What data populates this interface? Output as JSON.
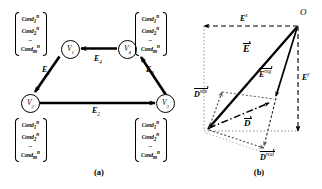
{
  "figure": {
    "panels": [
      {
        "id": "a",
        "caption": "(a)",
        "type": "directed-graph"
      },
      {
        "id": "b",
        "caption": "(b)",
        "type": "vector-decomposition"
      }
    ]
  },
  "panel_a": {
    "caption": "(a)",
    "nodes": [
      {
        "name": "V",
        "index": "1",
        "id": "v1"
      },
      {
        "name": "V",
        "index": "2",
        "id": "v2"
      },
      {
        "name": "V",
        "index": "3",
        "id": "v3"
      },
      {
        "name": "V",
        "index": "4",
        "id": "v4"
      }
    ],
    "edges": [
      {
        "name": "E",
        "index": "1",
        "from": "v1",
        "to": "v2"
      },
      {
        "name": "E",
        "index": "2",
        "from": "v2",
        "to": "v3"
      },
      {
        "name": "E",
        "index": "3",
        "from": "v3",
        "to": "v4"
      },
      {
        "name": "E",
        "index": "4",
        "from": "v4",
        "to": "v1"
      }
    ],
    "condition_blocks": [
      {
        "attached_to": "v1",
        "position": "top-left",
        "rows": [
          {
            "base": "Cond",
            "sub": "1",
            "sup": "n"
          },
          {
            "base": "Cond",
            "sub": "2",
            "sup": "n"
          },
          {
            "base": "...",
            "sub": "",
            "sup": ""
          },
          {
            "base": "Cond",
            "sub": "m",
            "sup": "n"
          }
        ]
      },
      {
        "attached_to": "v4",
        "position": "top-right",
        "rows": [
          {
            "base": "Cond",
            "sub": "1",
            "sup": "n"
          },
          {
            "base": "Cond",
            "sub": "2",
            "sup": "n"
          },
          {
            "base": "...",
            "sub": "",
            "sup": ""
          },
          {
            "base": "Cond",
            "sub": "m",
            "sup": "n"
          }
        ]
      },
      {
        "attached_to": "v2",
        "position": "bottom-left",
        "rows": [
          {
            "base": "Cond",
            "sub": "1",
            "sup": "n"
          },
          {
            "base": "Cond",
            "sub": "2",
            "sup": "n"
          },
          {
            "base": "...",
            "sub": "",
            "sup": ""
          },
          {
            "base": "Cond",
            "sub": "m",
            "sup": "n"
          }
        ]
      },
      {
        "attached_to": "v3",
        "position": "bottom-right",
        "rows": [
          {
            "base": "Cond",
            "sub": "1",
            "sup": "n"
          },
          {
            "base": "Cond",
            "sub": "2",
            "sup": "n"
          },
          {
            "base": "...",
            "sub": "",
            "sup": ""
          },
          {
            "base": "Cond",
            "sub": "m",
            "sup": "n"
          }
        ]
      }
    ]
  },
  "panel_b": {
    "caption": "(b)",
    "origin_label": "O",
    "vectors": [
      {
        "id": "E",
        "base": "E",
        "sup": "",
        "style": "solid-thick",
        "arrow": true
      },
      {
        "id": "Ereg",
        "base": "E",
        "sup": "reg",
        "style": "solid-thin",
        "arrow": true
      },
      {
        "id": "Ex",
        "base": "E",
        "sup": "x",
        "style": "dashed",
        "arrow": true
      },
      {
        "id": "Ey",
        "base": "E",
        "sup": "y",
        "style": "dashed",
        "arrow": true
      },
      {
        "id": "D",
        "base": "D",
        "sup": "",
        "style": "dash-dot",
        "arrow": true
      },
      {
        "id": "Dsim",
        "base": "D",
        "sup": "sim",
        "style": "dotted",
        "arrow": true
      },
      {
        "id": "Dreal",
        "base": "D",
        "sup": "real",
        "style": "dotted",
        "arrow": true
      }
    ]
  },
  "colors": {
    "stroke": "#000000",
    "background": "#ffffff",
    "dotted": "#555555"
  }
}
